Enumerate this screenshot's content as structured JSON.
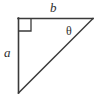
{
  "figure": {
    "kind": "right-triangle-diagram",
    "background_color": "#ffffff",
    "stroke_color": "#3a3a3a",
    "label_color": "#2e2e2e",
    "labels": {
      "side_a": "a",
      "side_b": "b",
      "angle_theta": "θ"
    },
    "geometry": {
      "vertices": {
        "top_left": [
          18,
          18
        ],
        "top_right": [
          93,
          18
        ],
        "bottom_left": [
          18,
          93
        ]
      },
      "right_angle_marker": {
        "corner": [
          18,
          18
        ],
        "size": 13
      },
      "edges": [
        {
          "name": "top-side-b",
          "from": [
            18,
            18
          ],
          "to": [
            93,
            18
          ]
        },
        {
          "name": "left-side-a",
          "from": [
            18,
            18
          ],
          "to": [
            18,
            93
          ]
        },
        {
          "name": "hypotenuse",
          "from": [
            93,
            18
          ],
          "to": [
            18,
            93
          ]
        }
      ]
    }
  }
}
